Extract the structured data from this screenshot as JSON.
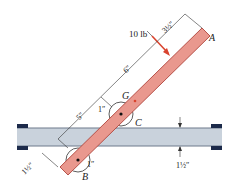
{
  "diagram": {
    "colors": {
      "bar_fill": "#e9988e",
      "bar_stroke": "#b0453c",
      "rail_fill": "#c9d2dc",
      "rail_edge": "#6e7b8c",
      "cap": "#1c2a4a",
      "force": "#d9432e",
      "dim": "#333333"
    },
    "points": {
      "A": "A",
      "B": "B",
      "C": "C",
      "G": "G"
    },
    "force": {
      "label": "10 lb"
    },
    "dimensions": {
      "a_to_force": "3½″",
      "force_to_g": "6″",
      "g_to_rail": "5″",
      "offset_g": "1″",
      "offset_b": "1″",
      "bar_width": "1½″",
      "rail_thickness": "1½″"
    }
  }
}
